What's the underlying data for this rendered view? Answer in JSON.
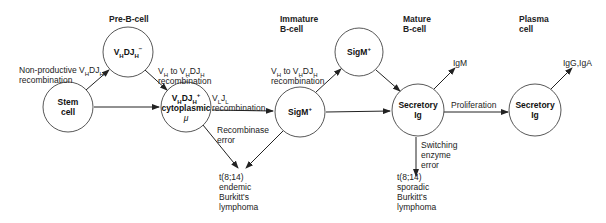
{
  "stages": {
    "pre_b": "Pre-B-cell",
    "immature_1": "Immature",
    "immature_2": "B-cell",
    "mature_1": "Mature",
    "mature_2": "B-cell",
    "plasma_1": "Plasma",
    "plasma_2": "cell"
  },
  "nodes": {
    "stem": {
      "line1": "Stem",
      "line2": "cell"
    },
    "vhdjh_neg": {
      "base": "V",
      "sub1": "H",
      "mid": "DJ",
      "sub2": "H",
      "sup": "−"
    },
    "vhdjh_pos": {
      "base": "V",
      "sub1": "H",
      "mid": "DJ",
      "sub2": "H",
      "sup": "+",
      "line2": "cytoplasmic",
      "line3": "μ"
    },
    "sigm_pos_upper": {
      "text": "SigM",
      "sup": "+"
    },
    "sigm_pos_lower": {
      "text": "SigM",
      "sup": "+"
    },
    "mature_secretory": {
      "line1": "Secretory",
      "line2": "Ig"
    },
    "plasma_secretory": {
      "line1": "Secretory",
      "line2": "Ig"
    }
  },
  "edge_labels": {
    "nonproductive_1": "Non-productive V",
    "nonproductive_sub1": "H",
    "nonproductive_mid": "DJ",
    "nonproductive_sub2": "H",
    "nonproductive_2": "recombination",
    "vh_to_vhdjh_a_1": "V",
    "vh_to_vhdjh_a_sub1": "H",
    "vh_to_vhdjh_a_mid": " to V",
    "vh_to_vhdjh_a_sub2": "H",
    "vh_to_vhdjh_a_mid2": "DJ",
    "vh_to_vhdjh_a_sub3": "H",
    "vh_to_vhdjh_a_2": "recombination",
    "vljl_1": "V",
    "vljl_sub1": "L",
    "vljl_mid": "J",
    "vljl_sub2": "L",
    "vljl_2": "recombination",
    "recombinase_1": "Recombinase",
    "recombinase_2": "error",
    "vh_to_vhdjh_b_1": "V",
    "vh_to_vhdjh_b_sub1": "H",
    "vh_to_vhdjh_b_mid": " to V",
    "vh_to_vhdjh_b_sub2": "H",
    "vh_to_vhdjh_b_mid2": "DJ",
    "vh_to_vhdjh_b_sub3": "H",
    "vh_to_vhdjh_b_2": "recombination",
    "igm": "IgM",
    "proliferation": "Proliferation",
    "switching_1": "Switching",
    "switching_2": "enzyme",
    "switching_3": "error",
    "iggiga": "IgG,IgA"
  },
  "outcomes": {
    "endemic": [
      "t(8;14)",
      "endemic",
      "Burkitt's",
      "lymphoma"
    ],
    "sporadic": [
      "t(8;14)",
      "sporadic",
      "Burkitt's",
      "lymphoma"
    ]
  },
  "colors": {
    "line": "#222222",
    "text": "#1a1a1a",
    "background": "#ffffff"
  }
}
